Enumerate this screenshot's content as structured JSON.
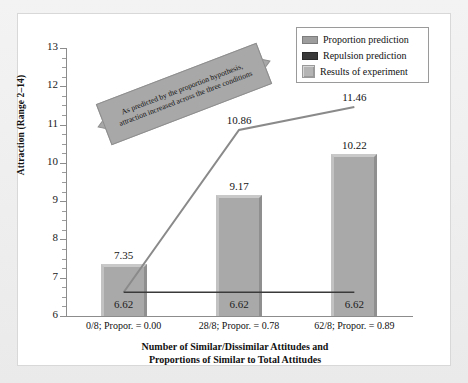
{
  "chart_data": {
    "type": "bar",
    "title": "",
    "xlabel": "Number of Similar/Dissimilar Attitudes and Proportions of Similar to Total Attitudes",
    "ylabel": "Attraction (Range 2–14)",
    "ylim": [
      6,
      13
    ],
    "ytick_labels": [
      "6",
      "7",
      "8",
      "9",
      "10",
      "11",
      "12",
      "13"
    ],
    "yticks": [
      6,
      7,
      8,
      9,
      10,
      11,
      12,
      13
    ],
    "minor_ticks": true,
    "grid": false,
    "legend_position": "top-right",
    "categories": [
      "0/8; Propor. = 0.00",
      "28/8; Propor. = 0.78",
      "62/8; Propor. = 0.89"
    ],
    "series": [
      {
        "name": "Proportion prediction",
        "type": "line",
        "color": "#8a8a8a",
        "values": [
          6.62,
          10.86,
          11.46
        ],
        "point_labels": [
          "",
          "10.86",
          "11.46"
        ]
      },
      {
        "name": "Repulsion prediction",
        "type": "line",
        "color": "#3a3a3a",
        "values": [
          6.62,
          6.62,
          6.62
        ],
        "point_labels": [
          "6.62",
          "6.62",
          "6.62"
        ]
      },
      {
        "name": "Results of experiment",
        "type": "bar",
        "color": "#a9a9a9",
        "values": [
          7.35,
          9.17,
          10.22
        ],
        "point_labels": [
          "7.35",
          "9.17",
          "10.22"
        ]
      }
    ],
    "annotations": [
      {
        "name": "proportion-hypothesis-banner",
        "text": "As predicted by the proportion hypothesis, attraction increased across the three conditions",
        "style": "double-headed-arrow-banner",
        "rotation_deg": -21
      }
    ]
  },
  "axes": {
    "y_title": "Attraction (Range 2–14)",
    "x_title_line1": "Number of Similar/Dissimilar Attitudes and",
    "x_title_line2": "Proportions of Similar to Total Attitudes",
    "y_ticks": [
      "13",
      "12",
      "11",
      "10",
      "9",
      "8",
      "7",
      "6"
    ],
    "x_ticks": [
      "0/8; Propor. = 0.00",
      "28/8; Propor. = 0.78",
      "62/8; Propor. = 0.89"
    ]
  },
  "legend": {
    "items": [
      {
        "label": "Proportion prediction",
        "swatch": "line-swatch-gray",
        "color": "#9d9d9d"
      },
      {
        "label": "Repulsion prediction",
        "swatch": "line-swatch-dark",
        "color": "#3a3a3a"
      },
      {
        "label": "Results of experiment",
        "swatch": "bar-swatch-gray",
        "color": "#b4b4b4"
      }
    ]
  },
  "bars": [
    {
      "top_label": "7.35",
      "inner_label": "6.62"
    },
    {
      "top_label": "9.17",
      "inner_label": "6.62"
    },
    {
      "top_label": "10.22",
      "inner_label": "6.62"
    }
  ],
  "line_labels": {
    "prop_point2": "10.86",
    "prop_point3": "11.46"
  },
  "callout": {
    "text": "As predicted by the proportion hypothesis, attraction increased across the three conditions"
  },
  "colors": {
    "bar_fill": "#a9a9a9",
    "bar_highlight": "#c9c9c9",
    "bar_shadow": "#8f8f8f",
    "proportion_line": "#8a8a8a",
    "repulsion_line": "#3a3a3a",
    "axis": "#8c8c8c",
    "panel_bg": "#ffffff",
    "page_bg": "#ececed"
  }
}
